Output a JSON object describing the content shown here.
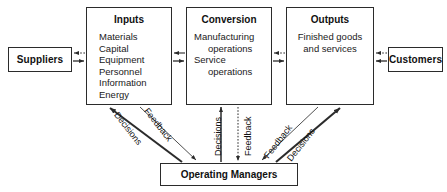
{
  "diagram": {
    "colors": {
      "line": "#2b2b2b",
      "text": "#111111",
      "background": "#ffffff"
    },
    "nodes": {
      "suppliers": {
        "label": "Suppliers"
      },
      "customers": {
        "label": "Customers"
      },
      "inputs": {
        "title": "Inputs",
        "items": [
          "Materials",
          "Capital",
          "Equipment",
          "Personnel",
          "Information",
          "Energy"
        ]
      },
      "conversion": {
        "title": "Conversion",
        "lines": [
          "Manufacturing",
          "operations",
          "Service",
          "operations"
        ]
      },
      "outputs": {
        "title": "Outputs",
        "lines": [
          "Finished goods",
          "and services"
        ]
      },
      "managers": {
        "label": "Operating Managers"
      }
    },
    "edge_labels": {
      "decisions_left": "Decisions",
      "feedback_left": "Feedback",
      "decisions_mid": "Decisions",
      "feedback_mid": "Feedback",
      "feedback_right": "Feedback",
      "decisions_right": "Decisions"
    }
  }
}
